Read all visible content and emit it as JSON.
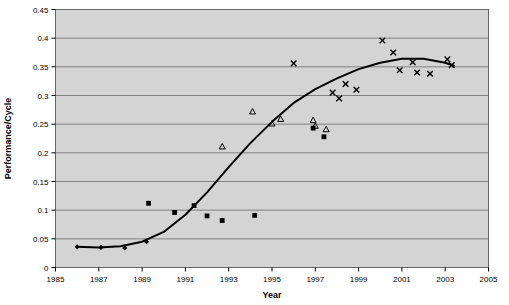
{
  "chart_data": {
    "type": "scatter",
    "title": "",
    "xlabel": "Year",
    "ylabel": "Performance/Cycle",
    "xlim": [
      1985,
      2005
    ],
    "ylim": [
      0,
      0.45
    ],
    "xticks": [
      1985,
      1987,
      1989,
      1991,
      1993,
      1995,
      1997,
      1999,
      2001,
      2003,
      2005
    ],
    "yticks": [
      0,
      0.05,
      0.1,
      0.15,
      0.2,
      0.25,
      0.3,
      0.35,
      0.4,
      0.45
    ],
    "xtick_labels": [
      "1985",
      "1987",
      "1989",
      "1991",
      "1993",
      "1995",
      "1997",
      "1999",
      "2001",
      "2003",
      "2005"
    ],
    "ytick_labels": [
      "0",
      "0.05",
      "0.1",
      "0.15",
      "0.2",
      "0.25",
      "0.3",
      "0.35",
      "0.4",
      "0.45"
    ],
    "grid": "horizontal",
    "legend": "none",
    "plot_background": "#d4d4d4",
    "grid_color": "#808080",
    "series": [
      {
        "name": "diamond-series",
        "marker": "diamond",
        "color": "#000000",
        "points": [
          {
            "x": 1986.0,
            "y": 0.036
          },
          {
            "x": 1987.1,
            "y": 0.035
          },
          {
            "x": 1988.2,
            "y": 0.034
          },
          {
            "x": 1989.2,
            "y": 0.045
          }
        ]
      },
      {
        "name": "square-series",
        "marker": "square",
        "color": "#000000",
        "points": [
          {
            "x": 1989.3,
            "y": 0.112
          },
          {
            "x": 1990.5,
            "y": 0.096
          },
          {
            "x": 1991.4,
            "y": 0.108
          },
          {
            "x": 1992.0,
            "y": 0.09
          },
          {
            "x": 1992.7,
            "y": 0.082
          },
          {
            "x": 1994.2,
            "y": 0.091
          },
          {
            "x": 1996.9,
            "y": 0.243
          },
          {
            "x": 1997.4,
            "y": 0.228
          }
        ]
      },
      {
        "name": "triangle-series",
        "marker": "triangle",
        "color": "#000000",
        "points": [
          {
            "x": 1992.7,
            "y": 0.211
          },
          {
            "x": 1994.1,
            "y": 0.272
          },
          {
            "x": 1995.0,
            "y": 0.251
          },
          {
            "x": 1995.4,
            "y": 0.259
          },
          {
            "x": 1996.9,
            "y": 0.257
          },
          {
            "x": 1997.0,
            "y": 0.247
          },
          {
            "x": 1997.5,
            "y": 0.241
          }
        ]
      },
      {
        "name": "cross-series",
        "marker": "cross",
        "color": "#000000",
        "points": [
          {
            "x": 1996.0,
            "y": 0.356
          },
          {
            "x": 1997.8,
            "y": 0.305
          },
          {
            "x": 1998.1,
            "y": 0.295
          },
          {
            "x": 1998.4,
            "y": 0.32
          },
          {
            "x": 1998.9,
            "y": 0.31
          },
          {
            "x": 2000.1,
            "y": 0.396
          },
          {
            "x": 2000.6,
            "y": 0.375
          },
          {
            "x": 2000.9,
            "y": 0.344
          },
          {
            "x": 2001.5,
            "y": 0.358
          },
          {
            "x": 2001.7,
            "y": 0.34
          },
          {
            "x": 2002.3,
            "y": 0.338
          },
          {
            "x": 2003.1,
            "y": 0.363
          },
          {
            "x": 2003.3,
            "y": 0.353
          }
        ]
      }
    ],
    "trend_line": {
      "name": "fitted-trend-curve",
      "color": "#000000",
      "width": 2,
      "points": [
        {
          "x": 1986.0,
          "y": 0.036
        },
        {
          "x": 1987.0,
          "y": 0.035
        },
        {
          "x": 1988.0,
          "y": 0.037
        },
        {
          "x": 1989.0,
          "y": 0.045
        },
        {
          "x": 1990.0,
          "y": 0.062
        },
        {
          "x": 1991.0,
          "y": 0.092
        },
        {
          "x": 1992.0,
          "y": 0.131
        },
        {
          "x": 1993.0,
          "y": 0.175
        },
        {
          "x": 1994.0,
          "y": 0.217
        },
        {
          "x": 1995.0,
          "y": 0.254
        },
        {
          "x": 1996.0,
          "y": 0.287
        },
        {
          "x": 1997.0,
          "y": 0.311
        },
        {
          "x": 1998.0,
          "y": 0.33
        },
        {
          "x": 1999.0,
          "y": 0.346
        },
        {
          "x": 2000.0,
          "y": 0.357
        },
        {
          "x": 2001.0,
          "y": 0.364
        },
        {
          "x": 2002.0,
          "y": 0.364
        },
        {
          "x": 2003.0,
          "y": 0.357
        },
        {
          "x": 2003.4,
          "y": 0.352
        }
      ]
    }
  }
}
